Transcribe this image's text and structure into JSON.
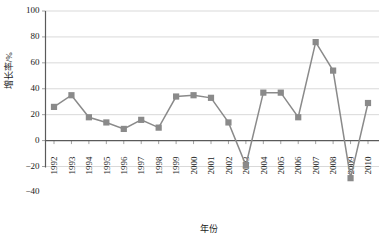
{
  "chart_data": {
    "type": "line",
    "title": "",
    "xlabel": "年份",
    "ylabel": "增长率/%",
    "categories": [
      "1992",
      "1993",
      "1994",
      "1995",
      "1996",
      "1997",
      "1998",
      "1999",
      "2000",
      "2001",
      "2002",
      "2003",
      "2004",
      "2005",
      "2006",
      "2007",
      "2008",
      "2009",
      "2010"
    ],
    "values": [
      26,
      35,
      18,
      14,
      9,
      16,
      10,
      34,
      35,
      33,
      14,
      -19,
      37,
      37,
      18,
      76,
      54,
      -29,
      29
    ],
    "series": [
      {
        "name": "增长率",
        "values": [
          26,
          35,
          18,
          14,
          9,
          16,
          10,
          34,
          35,
          33,
          14,
          -19,
          37,
          37,
          18,
          76,
          54,
          -29,
          29
        ]
      }
    ],
    "ylim": [
      -40,
      100
    ],
    "ytick_labels": [
      "100",
      "80",
      "60",
      "40",
      "20",
      "0",
      "-20",
      "-40"
    ],
    "ytick_values": [
      100,
      80,
      60,
      40,
      20,
      0,
      -20,
      -40
    ],
    "grid": true,
    "legend": "none",
    "marker": "square",
    "colors": {
      "series": "#8a8a8a",
      "grid": "#c8c8c8",
      "axis": "#5a5a5a",
      "text": "#1a1a1a",
      "background": "#ffffff"
    }
  }
}
